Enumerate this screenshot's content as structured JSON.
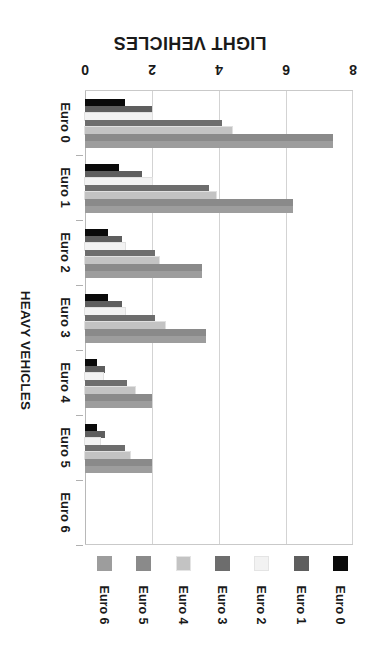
{
  "chart_data": {
    "type": "bar",
    "orientation": "horizontal",
    "title": "LIGHT VEHICLES",
    "xlabel": "",
    "ylabel": "HEAVY VEHICLES",
    "categories": [
      "Euro 0",
      "Euro 1",
      "Euro 2",
      "Euro 3",
      "Euro 4",
      "Euro 5",
      "Euro 6"
    ],
    "xlim": [
      0,
      8
    ],
    "xticks": [
      0,
      2,
      4,
      6,
      8
    ],
    "xtick_labels": [
      "0",
      "2",
      "4",
      "6",
      "8"
    ],
    "grid": true,
    "legend_position": "bottom",
    "series": [
      {
        "name": "Euro 0",
        "color": "#0a0a0a",
        "values": [
          1.2,
          1.0,
          0.7,
          0.7,
          0.35,
          0.35,
          0.0
        ]
      },
      {
        "name": "Euro 1",
        "color": "#5e5e5e",
        "values": [
          2.0,
          1.7,
          1.1,
          1.1,
          0.6,
          0.6,
          0.0
        ]
      },
      {
        "name": "Euro 2",
        "color": "#f2f2f2",
        "values": [
          2.0,
          2.0,
          1.2,
          1.2,
          0.55,
          0.45,
          0.0
        ]
      },
      {
        "name": "Euro 3",
        "color": "#6d6d6d",
        "values": [
          4.1,
          3.7,
          2.1,
          2.1,
          1.25,
          1.2,
          0.0
        ]
      },
      {
        "name": "Euro 4",
        "color": "#c3c3c3",
        "values": [
          4.4,
          3.9,
          2.2,
          2.4,
          1.5,
          1.35,
          0.0
        ]
      },
      {
        "name": "Euro 5",
        "color": "#8a8a8a",
        "values": [
          7.4,
          6.2,
          3.5,
          3.6,
          2.0,
          2.0,
          0.0
        ]
      },
      {
        "name": "Euro 6",
        "color": "#9d9d9d",
        "values": [
          7.4,
          6.2,
          3.5,
          3.6,
          2.0,
          2.0,
          0.0
        ]
      }
    ]
  },
  "legend": {
    "items": [
      {
        "label": "Euro 6",
        "color": "#9d9d9d"
      },
      {
        "label": "Euro 5",
        "color": "#8a8a8a"
      },
      {
        "label": "Euro 4",
        "color": "#c3c3c3"
      },
      {
        "label": "Euro 3",
        "color": "#6d6d6d"
      },
      {
        "label": "Euro 2",
        "color": "#f2f2f2"
      },
      {
        "label": "Euro 1",
        "color": "#5e5e5e"
      },
      {
        "label": "Euro 0",
        "color": "#0a0a0a"
      }
    ]
  }
}
